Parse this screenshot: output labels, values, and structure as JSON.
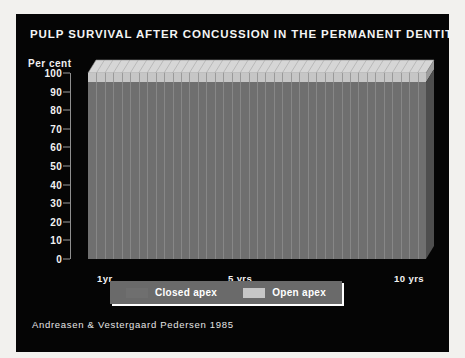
{
  "slide": {
    "title": "PULP SURVIVAL AFTER CONCUSSION IN THE PERMANENT DENTITION",
    "source": "Andreasen & Vestergaard Pedersen 1985",
    "background_color": "#050505",
    "text_color": "#f4f4f4",
    "frame_color": "#f2f1ee"
  },
  "legend": {
    "position": "bottom-center",
    "items": [
      {
        "label": "Closed apex",
        "color": "#6f6f6f"
      },
      {
        "label": "Open apex",
        "color": "#c6c6c6"
      }
    ]
  },
  "chart_data": {
    "type": "area",
    "title": "PULP SURVIVAL AFTER CONCUSSION IN THE PERMANENT DENTITION",
    "subtitle": "",
    "xlabel": "",
    "ylabel": "Per cent",
    "ylim": [
      0,
      100
    ],
    "yticks": [
      0,
      10,
      20,
      30,
      40,
      50,
      60,
      70,
      80,
      90,
      100
    ],
    "ytick_labels": [
      "0",
      "10",
      "20",
      "30",
      "40",
      "50",
      "60",
      "70",
      "80",
      "90",
      "100"
    ],
    "xlim": [
      0,
      10
    ],
    "xticks": [
      1,
      5,
      10
    ],
    "xtick_labels": [
      "1yr",
      "5 yrs",
      "10 yrs"
    ],
    "grid": false,
    "stacked": true,
    "three_d": true,
    "legend_position": "bottom-center",
    "annotations": [
      "Andreasen & Vestergaard Pedersen 1985"
    ],
    "x": [
      0,
      0.25,
      0.5,
      0.75,
      1,
      1.5,
      2,
      2.5,
      3,
      3.5,
      4,
      4.5,
      5,
      5.5,
      6,
      6.5,
      7,
      7.5,
      8,
      8.5,
      9,
      9.5,
      10
    ],
    "series": [
      {
        "name": "Closed apex",
        "color": "#6f6f6f",
        "values": [
          100,
          98,
          96,
          95.5,
          95,
          95,
          95,
          95,
          95,
          95,
          95,
          95,
          95,
          95,
          95,
          95,
          95,
          95,
          95,
          95,
          95,
          95,
          95
        ]
      },
      {
        "name": "Open apex",
        "color": "#c6c6c6",
        "values": [
          100,
          100,
          100,
          100,
          100,
          100,
          100,
          100,
          100,
          100,
          100,
          100,
          100,
          100,
          100,
          100,
          100,
          100,
          100,
          100,
          100,
          100,
          100
        ]
      }
    ],
    "n_bars": 40
  }
}
